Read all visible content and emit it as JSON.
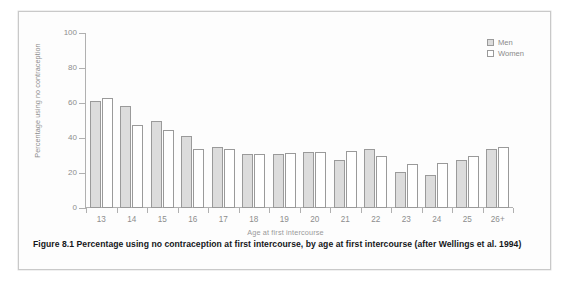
{
  "figure": {
    "caption": "Figure 8.1  Percentage using no contraception at first intercourse, by age at first intercourse (after Wellings et al. 1994)"
  },
  "legend": {
    "position": "top-right",
    "entries": [
      {
        "label": "Men",
        "swatch": "hatched-grey-square"
      },
      {
        "label": "Women",
        "swatch": "white-square"
      }
    ]
  },
  "colors": {
    "men_fill": "#dcdcdc",
    "women_fill": "#ffffff",
    "bar_stroke": "#9a9a9a",
    "axis": "#b0b0b0",
    "axis_text": "#8d8d8d",
    "caption_text": "#15171a",
    "card_background": "#fdfdfd",
    "card_border": "#c9c9c9"
  },
  "chart_data": {
    "type": "bar",
    "title": "",
    "subtitle": "",
    "xlabel": "Age at first intercourse",
    "ylabel": "Percentage using no contraception",
    "categories": [
      "13",
      "14",
      "15",
      "16",
      "17",
      "18",
      "19",
      "20",
      "21",
      "22",
      "23",
      "24",
      "25",
      "26+"
    ],
    "series": [
      {
        "name": "Men",
        "values": [
          61,
          58.5,
          50,
          41,
          35,
          31,
          31,
          32,
          27.5,
          33.5,
          20.5,
          19,
          27.5,
          33.5
        ]
      },
      {
        "name": "Women",
        "values": [
          63,
          47.5,
          44.5,
          34,
          34,
          31,
          31.5,
          32,
          32.5,
          29.5,
          25,
          26,
          29.5,
          35
        ]
      }
    ],
    "ylim": [
      0,
      100
    ],
    "yticks": [
      0,
      20,
      40,
      60,
      80,
      100
    ],
    "ytick_labels": [
      "0",
      "20",
      "40",
      "60",
      "80",
      "100"
    ],
    "grid": false,
    "legend_position": "top-right"
  }
}
